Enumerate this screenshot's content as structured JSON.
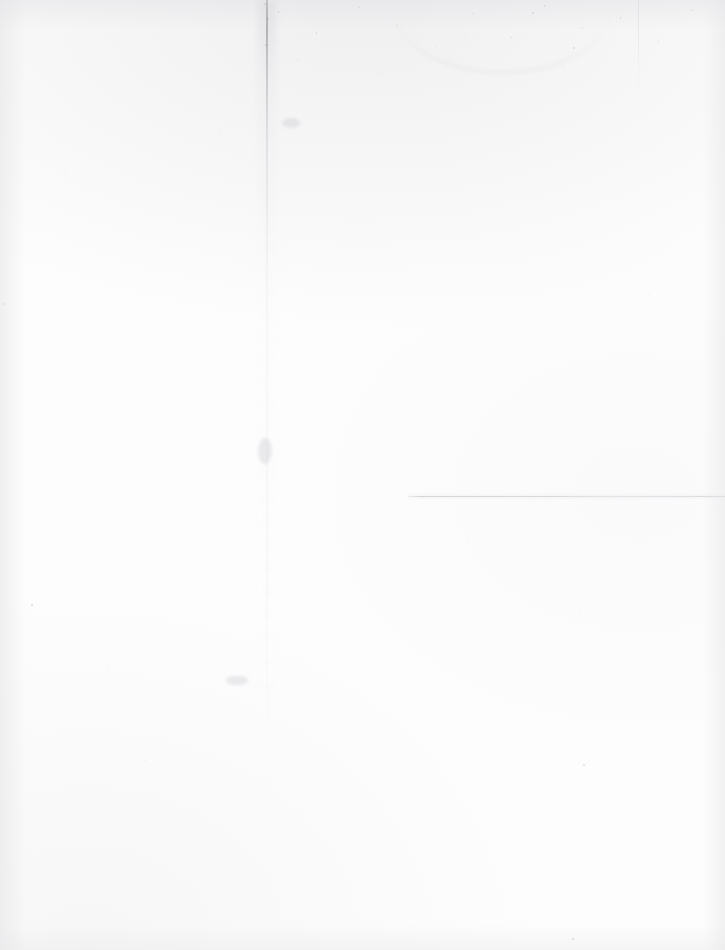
{
  "document": {
    "kind": "scanned-page",
    "content_state": "blank",
    "page_width": 725,
    "page_height": 950,
    "text_content": "",
    "visible_text_blocks": [],
    "paper_color": "#fdfdfd",
    "ink_color": "#78787e"
  },
  "marks": {
    "vertical_crease": {
      "name": "vertical-fold-crease",
      "x": 266,
      "y_start": 0,
      "y_end": 950,
      "color": "#78787e",
      "note": "full-height fold line, darkest at the top edge"
    },
    "horizontal_rule": {
      "name": "horizontal-rule-line",
      "x_start": 408,
      "x_end": 725,
      "y": 496,
      "color": "#ced0d6",
      "note": "faint light-gray rule across the right half"
    },
    "vertical_rule_right": {
      "name": "short-vertical-rule",
      "x": 638,
      "y_start": 0,
      "y_end": 92,
      "color": "#d6d6db",
      "note": "faint short rule near the upper right"
    },
    "top_speckle_band": {
      "name": "dust-speckle-band",
      "x_start": 250,
      "x_end": 725,
      "y_start": 0,
      "y_end": 150,
      "note": "dense scanner dust and grain along the top edge"
    },
    "smudge_arc": {
      "name": "curved-smudge",
      "x": 395,
      "y": 10,
      "width": 215,
      "height": 62,
      "note": "faint arc-shaped smudge near the top"
    }
  },
  "specks": [
    {
      "name": "speck-top-crease",
      "x": 264,
      "y": 3,
      "size": 2.4,
      "opacity": 0.62
    },
    {
      "name": "speck-top-crease-2",
      "x": 267,
      "y": 18,
      "size": 1.8,
      "opacity": 0.48
    },
    {
      "name": "speck-top-crease-3",
      "x": 265,
      "y": 44,
      "size": 1.6,
      "opacity": 0.42
    },
    {
      "name": "speck-top-arc",
      "x": 532,
      "y": 12,
      "size": 1.7,
      "opacity": 0.4
    },
    {
      "name": "speck-top-arc-2",
      "x": 573,
      "y": 47,
      "size": 1.5,
      "opacity": 0.36
    },
    {
      "name": "speck-upper-right",
      "x": 466,
      "y": 38,
      "size": 1.4,
      "opacity": 0.34
    },
    {
      "name": "speck-left-mid",
      "x": 3,
      "y": 303,
      "size": 1.6,
      "opacity": 0.4
    },
    {
      "name": "speck-left-lower",
      "x": 31,
      "y": 604,
      "size": 1.8,
      "opacity": 0.45
    },
    {
      "name": "speck-left-low-2",
      "x": 7,
      "y": 527,
      "size": 1.3,
      "opacity": 0.3
    },
    {
      "name": "speck-body-1",
      "x": 220,
      "y": 130,
      "size": 1.4,
      "opacity": 0.32
    },
    {
      "name": "speck-body-2",
      "x": 356,
      "y": 130,
      "size": 1.2,
      "opacity": 0.28
    },
    {
      "name": "speck-body-3",
      "x": 330,
      "y": 298,
      "size": 1.2,
      "opacity": 0.26
    },
    {
      "name": "speck-body-4",
      "x": 468,
      "y": 537,
      "size": 1.3,
      "opacity": 0.28
    },
    {
      "name": "speck-body-5",
      "x": 580,
      "y": 614,
      "size": 1.4,
      "opacity": 0.3
    },
    {
      "name": "speck-body-6",
      "x": 108,
      "y": 668,
      "size": 1.3,
      "opacity": 0.28
    },
    {
      "name": "speck-body-7",
      "x": 583,
      "y": 764,
      "size": 1.6,
      "opacity": 0.36
    },
    {
      "name": "speck-body-8",
      "x": 144,
      "y": 760,
      "size": 1.2,
      "opacity": 0.26
    },
    {
      "name": "speck-bottom-right",
      "x": 572,
      "y": 938,
      "size": 2.2,
      "opacity": 0.58
    },
    {
      "name": "speck-bottom-mid",
      "x": 443,
      "y": 933,
      "size": 1.3,
      "opacity": 0.3
    },
    {
      "name": "speck-body-9",
      "x": 648,
      "y": 294,
      "size": 1.2,
      "opacity": 0.26
    },
    {
      "name": "speck-body-10",
      "x": 612,
      "y": 497,
      "size": 1.2,
      "opacity": 0.26
    }
  ],
  "smudges": [
    {
      "name": "smudge-lower-left-crease",
      "x": 226,
      "y": 676,
      "width": 22,
      "height": 9
    },
    {
      "name": "smudge-mid-crease",
      "x": 258,
      "y": 438,
      "width": 14,
      "height": 26
    },
    {
      "name": "smudge-top-left-band",
      "x": 282,
      "y": 118,
      "width": 18,
      "height": 10
    }
  ]
}
